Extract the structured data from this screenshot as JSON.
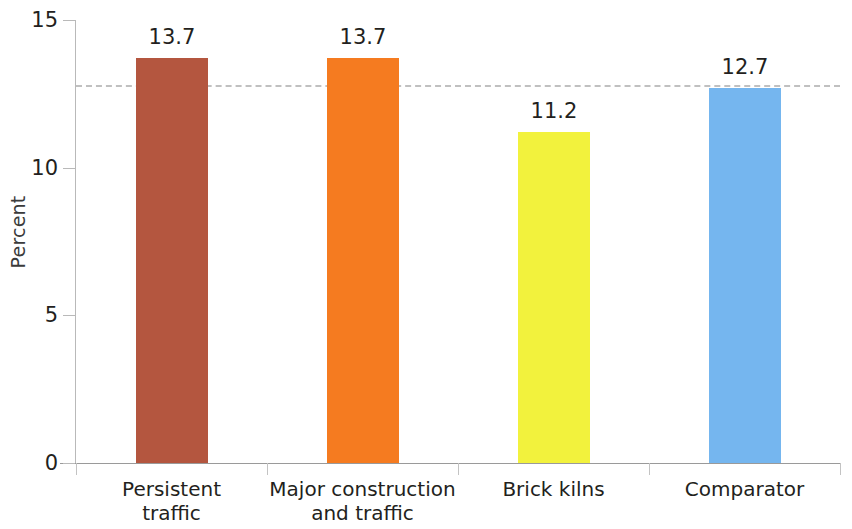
{
  "chart_data": {
    "type": "bar",
    "title": "",
    "subtitle": "",
    "xlabel": "",
    "ylabel": "Percent",
    "categories": [
      "Persistent\ntraffic",
      "Major construction\nand traffic",
      "Brick kilns",
      "Comparator"
    ],
    "values": [
      13.7,
      13.7,
      11.2,
      12.7
    ],
    "value_labels": [
      "13.7",
      "13.7",
      "11.2",
      "12.7"
    ],
    "bar_colors": [
      "#b4563f",
      "#f57b20",
      "#f2f23d",
      "#75b6ef"
    ],
    "ylim": [
      0,
      15
    ],
    "yticks": [
      0,
      5,
      10,
      15
    ],
    "ytick_labels": [
      "0",
      "5",
      "10",
      "15"
    ],
    "grid": false,
    "legend": "none",
    "reference_line": {
      "value": 12.8,
      "style": "dashed",
      "color": "#c0c0c0",
      "label": ""
    }
  },
  "axes": {
    "y_title": "Percent"
  }
}
